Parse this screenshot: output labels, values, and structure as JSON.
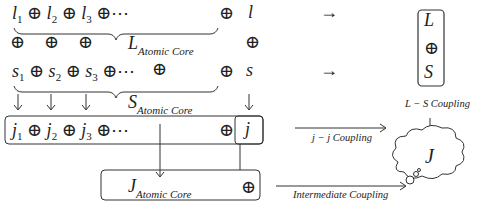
{
  "rows": {
    "l_row": {
      "terms": [
        "l",
        "l",
        "l"
      ],
      "subs": [
        "1",
        "2",
        "3"
      ],
      "op": "⊕",
      "ellipsis": "⊕⋯",
      "total": "l",
      "total_op": "⊕"
    },
    "l_core_label": {
      "symbol": "L",
      "sub": "Atomic Core"
    },
    "oplus_row": [
      "⊕",
      "⊕",
      "⊕"
    ],
    "s_row": {
      "terms": [
        "s",
        "s",
        "s"
      ],
      "subs": [
        "1",
        "2",
        "3"
      ],
      "op": "⊕",
      "ellipsis": "⊕⋯",
      "mid_op": "⊕",
      "total": "s",
      "total_op": "⊕"
    },
    "s_core_label": {
      "symbol": "S",
      "sub": "Atomic Core"
    },
    "j_row": {
      "terms": [
        "j",
        "j",
        "j"
      ],
      "subs": [
        "1",
        "2",
        "3"
      ],
      "op": "⊕",
      "ellipsis": "⊕⋯",
      "total": "j",
      "total_op": "⊕"
    },
    "j_core_label": {
      "symbol": "J",
      "sub": "Atomic Core",
      "op": "⊕"
    }
  },
  "ls_box": {
    "top": "L",
    "mid": "⊕",
    "bottom": "S"
  },
  "arrows": {
    "right": "→",
    "down": "↓"
  },
  "labels": {
    "ls_coupling": "L − S Coupling",
    "jj_coupling": "j − j Coupling",
    "intermediate_coupling": "Intermediate Coupling"
  },
  "result": {
    "symbol": "J"
  }
}
